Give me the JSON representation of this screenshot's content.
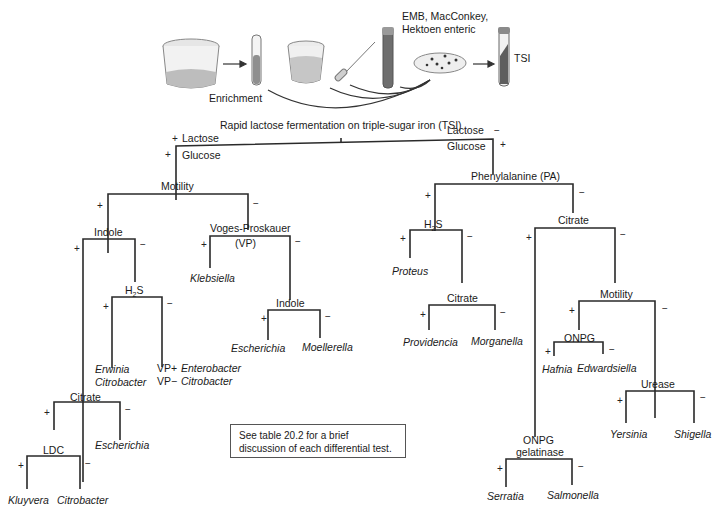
{
  "diagram": {
    "title": "Rapid lactose fermentation on triple-sugar iron (TSI)",
    "workflow": {
      "enrichment_label": "Enrichment",
      "media_label_line1": "EMB, MacConkey,",
      "media_label_line2": "Hektoen enteric",
      "tsi_label": "TSI",
      "icons": [
        "sample-beaker-icon",
        "enrichment-tube-icon",
        "broth-cup-icon",
        "pipette-icon",
        "culture-tube-icon",
        "petri-dish-icon",
        "tsi-slant-tube-icon"
      ]
    },
    "root": {
      "left_branch": {
        "lactose": "Lactose",
        "lactose_sign": "+",
        "glucose": "Glucose",
        "glucose_sign": "+"
      },
      "right_branch": {
        "lactose": "Lactose",
        "lactose_sign": "−",
        "glucose": "Glucose",
        "glucose_sign": "+"
      }
    },
    "left": {
      "motility": "Motility",
      "indole": "Indole",
      "vp_line1": "Voges-Proskauer",
      "vp_line2": "(VP)",
      "klebsiella": "Klebsiella",
      "indole2": "Indole",
      "escherichia": "Escherichia",
      "moellerella": "Moellerella",
      "h2s_main": "H",
      "h2s_sub": "2",
      "h2s_tail": "S",
      "erwinia": "Erwinia",
      "citrobacter": "Citrobacter",
      "vp_plus": "VP+",
      "enterobacter": "Enterobacter",
      "vp_minus": "VP−",
      "citrobacter2": "Citrobacter",
      "citrate": "Citrate",
      "escherichia2": "Escherichia",
      "ldc": "LDC",
      "kluyvera": "Kluyvera",
      "citrobacter3": "Citrobacter"
    },
    "right": {
      "pa": "Phenylalanine (PA)",
      "h2s_main": "H",
      "h2s_sub": "2",
      "h2s_tail": "S",
      "proteus": "Proteus",
      "citrate_a": "Citrate",
      "providencia": "Providencia",
      "morganella": "Morganella",
      "citrate_b": "Citrate",
      "motility": "Motility",
      "onpg": "ONPG",
      "hafnia": "Hafnia",
      "edwardsiella": "Edwardsiella",
      "urease": "Urease",
      "yersinia": "Yersinia",
      "shigella": "Shigella",
      "onpg_gel_line1": "ONPG",
      "onpg_gel_line2": "gelatinase",
      "serratia": "Serratia",
      "salmonella": "Salmonella"
    },
    "signs": {
      "plus": "+",
      "minus": "−"
    },
    "note": "See table 20.2 for a brief discussion of each differential test."
  }
}
